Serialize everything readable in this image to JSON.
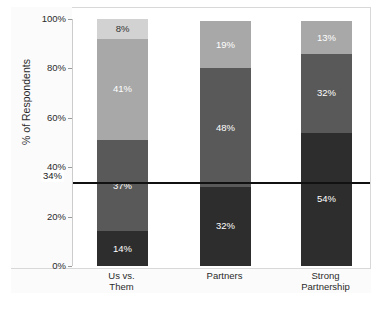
{
  "chart_data": {
    "type": "bar",
    "subtype": "stacked-bar-100",
    "title": "",
    "xlabel": "",
    "ylabel": "% of Respondents",
    "ylim": [
      0,
      100
    ],
    "grid": false,
    "legend": "none",
    "categories": [
      "Us vs. Them",
      "Partners",
      "Strong Partnership"
    ],
    "category_lines": [
      [
        "Us vs.",
        "Them"
      ],
      [
        "Partners",
        ""
      ],
      [
        "Strong",
        "Partnership"
      ]
    ],
    "y_ticks": [
      "0%",
      "20%",
      "40%",
      "60%",
      "80%",
      "100%"
    ],
    "y_tick_values": [
      0,
      20,
      40,
      60,
      80,
      100
    ],
    "series": [
      {
        "name": "Segment 1 (darkest)",
        "color": "#2d2d2d",
        "values": [
          14,
          32,
          54
        ],
        "labels": [
          "14%",
          "32%",
          "54%"
        ]
      },
      {
        "name": "Segment 2 (dark gray)",
        "color": "#595959",
        "values": [
          37,
          48,
          32
        ],
        "labels": [
          "37%",
          "48%",
          "32%"
        ]
      },
      {
        "name": "Segment 3 (medium gray)",
        "color": "#a8a8a8",
        "values": [
          41,
          19,
          13
        ],
        "labels": [
          "41%",
          "19%",
          "13%"
        ]
      },
      {
        "name": "Segment 4 (light gray)",
        "color": "#d2d2d2",
        "values": [
          8,
          0,
          0
        ],
        "labels": [
          "8%",
          "",
          ""
        ]
      }
    ],
    "reference_line": {
      "label": "34%",
      "value": 34,
      "color": "#111111"
    },
    "colors": {
      "darkest": "#2d2d2d",
      "dark": "#595959",
      "medium": "#a8a8a8",
      "light": "#d2d2d2",
      "frame": "#d8d8d8",
      "band": "#fbfbfb",
      "text": "#2b2b2b",
      "label_on_dark": "#ffffff",
      "label_on_light": "#333333",
      "reference": "#111111"
    }
  }
}
